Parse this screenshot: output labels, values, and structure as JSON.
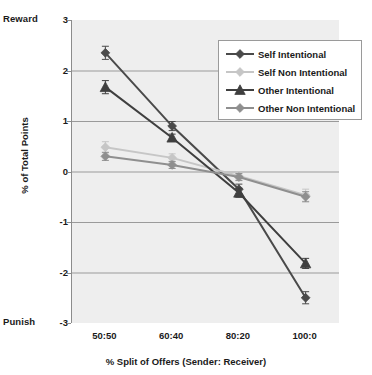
{
  "chart_data": {
    "type": "line",
    "title": "",
    "xlabel": "% Split of Offers (Sender: Receiver)",
    "ylabel": "% of Total Points",
    "categories": [
      "50:50",
      "60:40",
      "80:20",
      "100:0"
    ],
    "ylim": [
      -3,
      3
    ],
    "yticks": [
      3,
      2,
      1,
      0,
      -1,
      -2,
      -3
    ],
    "ytick_labels": [
      "3",
      "2",
      "1",
      "0",
      "-1",
      "-2",
      "-3"
    ],
    "y_axis_top_annotation": "Reward",
    "y_axis_bottom_annotation": "Punish",
    "grid": true,
    "legend_position": "top-right",
    "series": [
      {
        "name": "Self Intentional",
        "marker": "diamond",
        "color": "#4a4a4a",
        "values": [
          2.35,
          0.9,
          -0.35,
          -2.5
        ],
        "errors": [
          0.13,
          0.09,
          0.1,
          0.12
        ]
      },
      {
        "name": "Self Non Intentional",
        "marker": "diamond",
        "color": "#c6c6c6",
        "values": [
          0.48,
          0.27,
          -0.09,
          -0.47
        ],
        "errors": [
          0.11,
          0.08,
          0.08,
          0.12
        ]
      },
      {
        "name": "Other Intentional",
        "marker": "triangle",
        "color": "#3f3f3f",
        "values": [
          1.67,
          0.67,
          -0.42,
          -1.82
        ],
        "errors": [
          0.13,
          0.07,
          0.09,
          0.1
        ]
      },
      {
        "name": "Other Non Intentional",
        "marker": "diamond",
        "color": "#8f8f8f",
        "values": [
          0.3,
          0.13,
          -0.11,
          -0.5
        ],
        "errors": [
          0.08,
          0.07,
          0.07,
          0.1
        ]
      }
    ]
  },
  "legend": {
    "entries": [
      {
        "label": "Self Intentional"
      },
      {
        "label": "Self Non Intentional"
      },
      {
        "label": "Other Intentional"
      },
      {
        "label": "Other Non Intentional"
      }
    ]
  },
  "colors": {
    "plot_background": "#eeeeee",
    "gridline": "#9a9a9a",
    "axis": "#8c8c8c",
    "text": "#1a1a1a"
  }
}
